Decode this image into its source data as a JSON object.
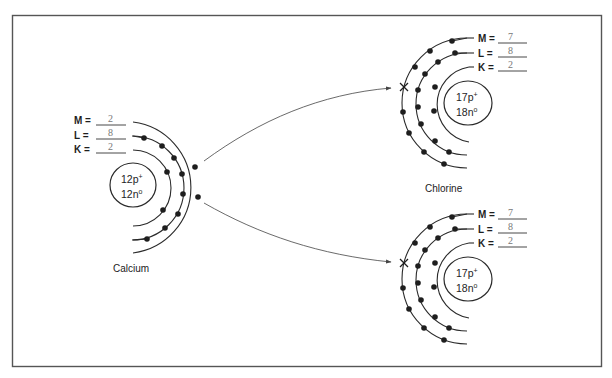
{
  "diagram": {
    "atoms": [
      {
        "id": "calcium",
        "name": "Calcium",
        "nucleus": {
          "protons": "12p",
          "protons_sup": "+",
          "neutrons": "12n",
          "neutrons_sup": "o"
        },
        "shells": [
          {
            "label": "M =",
            "value": "2"
          },
          {
            "label": "L =",
            "value": "8"
          },
          {
            "label": "K =",
            "value": "2"
          }
        ]
      },
      {
        "id": "chlorine-top",
        "name": "Chlorine",
        "nucleus": {
          "protons": "17p",
          "protons_sup": "+",
          "neutrons": "18n",
          "neutrons_sup": "o"
        },
        "shells": [
          {
            "label": "M =",
            "value": "7"
          },
          {
            "label": "L =",
            "value": "8"
          },
          {
            "label": "K =",
            "value": "2"
          }
        ]
      },
      {
        "id": "chlorine-bottom",
        "name": "",
        "nucleus": {
          "protons": "17p",
          "protons_sup": "+",
          "neutrons": "18n",
          "neutrons_sup": "o"
        },
        "shells": [
          {
            "label": "M =",
            "value": "7"
          },
          {
            "label": "L =",
            "value": "8"
          },
          {
            "label": "K =",
            "value": "2"
          }
        ]
      }
    ],
    "transfers": [
      {
        "from": "calcium",
        "to": "chlorine-top",
        "marker": "x"
      },
      {
        "from": "calcium",
        "to": "chlorine-bottom",
        "marker": "x"
      }
    ],
    "colors": {
      "line": "#2a2a2a",
      "frame": "#555555",
      "value_text": "#777777"
    }
  }
}
